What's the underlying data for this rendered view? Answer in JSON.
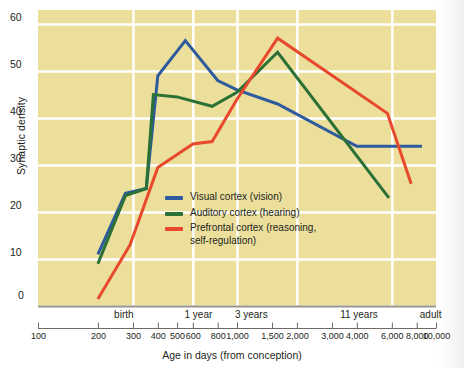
{
  "chart_data": {
    "type": "line",
    "title": "",
    "xlabel": "Age in days (from conception)",
    "ylabel": "Synaptic density",
    "xscale": "log",
    "xlim": [
      100,
      10000
    ],
    "ylim": [
      0,
      63
    ],
    "grid": true,
    "legend_position": "center-left-inside",
    "ytick_labels": [
      "0",
      "10",
      "20",
      "30",
      "40",
      "50",
      "60"
    ],
    "ytick_values": [
      0,
      10,
      20,
      30,
      40,
      50,
      60
    ],
    "xtick_labels": [
      "100",
      "200",
      "300",
      "400",
      "500",
      "600",
      "800",
      "1,000",
      "1,500",
      "2,000",
      "3,000",
      "4,000",
      "6,000",
      "8,000",
      "10,000"
    ],
    "xtick_values": [
      100,
      200,
      300,
      400,
      500,
      600,
      800,
      1000,
      1500,
      2000,
      3000,
      4000,
      6000,
      8000,
      10000
    ],
    "era_labels": [
      {
        "label": "birth",
        "value": 270
      },
      {
        "label": "1 year",
        "value": 640
      },
      {
        "label": "3 years",
        "value": 1180
      },
      {
        "label": "11 years",
        "value": 4100
      },
      {
        "label": "adult",
        "value": 9400
      }
    ],
    "gridline_x_values": [
      300,
      600,
      1000,
      2000,
      6000
    ],
    "series": [
      {
        "name": "Visual cortex (vision)",
        "color": "#2d5b9e",
        "points": [
          {
            "x": 200,
            "y": 11
          },
          {
            "x": 275,
            "y": 24
          },
          {
            "x": 350,
            "y": 25
          },
          {
            "x": 400,
            "y": 49
          },
          {
            "x": 550,
            "y": 56.5
          },
          {
            "x": 800,
            "y": 48
          },
          {
            "x": 1000,
            "y": 46
          },
          {
            "x": 1600,
            "y": 43
          },
          {
            "x": 4000,
            "y": 34
          },
          {
            "x": 8500,
            "y": 34
          }
        ]
      },
      {
        "name": "Auditory cortex (hearing)",
        "color": "#2b7035",
        "points": [
          {
            "x": 200,
            "y": 9
          },
          {
            "x": 275,
            "y": 23.5
          },
          {
            "x": 350,
            "y": 25
          },
          {
            "x": 380,
            "y": 45
          },
          {
            "x": 500,
            "y": 44.5
          },
          {
            "x": 750,
            "y": 42.5
          },
          {
            "x": 1000,
            "y": 45.5
          },
          {
            "x": 1600,
            "y": 54
          },
          {
            "x": 5800,
            "y": 23
          }
        ]
      },
      {
        "name": "Prefrontal cortex (reasoning, self-regulation)",
        "color": "#e8482c",
        "points": [
          {
            "x": 200,
            "y": 1.5
          },
          {
            "x": 290,
            "y": 13
          },
          {
            "x": 400,
            "y": 29.5
          },
          {
            "x": 600,
            "y": 34.5
          },
          {
            "x": 750,
            "y": 35
          },
          {
            "x": 1000,
            "y": 44
          },
          {
            "x": 1600,
            "y": 57
          },
          {
            "x": 5700,
            "y": 41
          },
          {
            "x": 7500,
            "y": 26
          }
        ]
      }
    ],
    "legend": [
      {
        "label": "Visual cortex (vision)",
        "color": "#2d5b9e"
      },
      {
        "label": "Auditory cortex (hearing)",
        "color": "#2b7035"
      },
      {
        "label": "Prefrontal cortex (reasoning,\nself-regulation)",
        "color": "#e8482c"
      }
    ],
    "colors": {
      "plot_background": "#ecdf9c",
      "gridline": "#ffffff",
      "axis_line": "#9a948a",
      "text": "#231f20"
    }
  }
}
